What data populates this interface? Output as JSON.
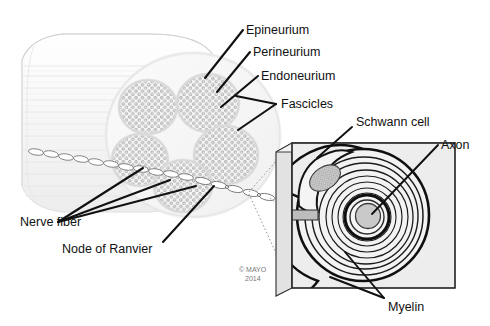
{
  "figure": {
    "background_color": "#ffffff",
    "copyright_line1": "© MAYO",
    "copyright_line2": "2014"
  },
  "labels": {
    "epineurium": "Epineurium",
    "perineurium": "Perineurium",
    "endoneurium": "Endoneurium",
    "fascicles": "Fascicles",
    "nerve_fiber": "Nerve fiber",
    "node_of_ranvier": "Node of Ranvier",
    "schwann_cell": "Schwann cell",
    "axon": "Axon",
    "myelin": "Myelin"
  },
  "nerve_trunk": {
    "description": "Cut cylindrical peripheral nerve trunk shown in 3/4 view with longitudinal striations",
    "fill": "#fafafa",
    "stroke": "#d6d6d6",
    "fascicle_count": 5,
    "fascicle_fill": "#f2f2f2",
    "axon_dot_color": "#9a9a9a"
  },
  "inset": {
    "description": "Magnified cross-section of a single myelinated nerve fiber",
    "box_fill": "#ededed",
    "side_panel_fill": "#e2e2e2",
    "myelin_ring_count": 9,
    "axon_fill": "#c9c9c9",
    "schwann_nucleus_fill": "#c0c0c0"
  },
  "colors": {
    "text": "#111111",
    "leader_line": "#111111",
    "dotted_guide": "#8a8a8a",
    "outline_dark": "#1a1a1a"
  }
}
